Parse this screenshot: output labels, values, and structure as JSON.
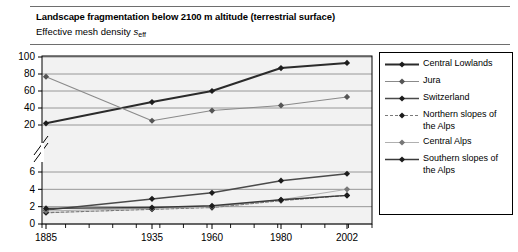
{
  "header": {
    "title": "Landscape fragmentation below 2100 m altitude (terrestrial surface)",
    "subtitle_prefix": "Effective mesh density ",
    "subtitle_symbol": "s",
    "subtitle_subscript": "eff"
  },
  "legend": {
    "items": [
      {
        "label": "Central Lowlands",
        "color": "#2b2b2b",
        "width": 1.9,
        "dash": "none"
      },
      {
        "label": "Jura",
        "color": "#8a8a8a",
        "width": 1.1,
        "dash": "none"
      },
      {
        "label": "Switzerland",
        "color": "#4a4a4a",
        "width": 1.5,
        "dash": "none"
      },
      {
        "label": "Northern slopes of the Alps",
        "color": "#7a7a7a",
        "width": 1.2,
        "dash": "3,2"
      },
      {
        "label": "Central Alps",
        "color": "#b0b0b0",
        "width": 1.1,
        "dash": "none"
      },
      {
        "label": "Southern slopes of the Alps",
        "color": "#3a3a3a",
        "width": 1.4,
        "dash": "none"
      }
    ]
  },
  "axis": {
    "x_ticks": [
      "1885",
      "1935",
      "1960",
      "1980",
      "2002"
    ],
    "y_ticks_lower": [
      "0",
      "2",
      "4",
      "6"
    ],
    "y_ticks_upper": [
      "20",
      "40",
      "60",
      "80",
      "100"
    ],
    "break_note": "axis-break"
  },
  "colors": {
    "gridline": "#808080",
    "frame": "#000000",
    "plot_background": "#f2f2f2",
    "rule": "#6e6e6e"
  },
  "chart_data": {
    "type": "line",
    "title": "Landscape fragmentation below 2100 m altitude (terrestrial surface)",
    "subtitle": "Effective mesh density s_eff",
    "xlabel": "",
    "ylabel": "",
    "x": [
      "1885",
      "1935",
      "1960",
      "1980",
      "2002"
    ],
    "axis_break": true,
    "ylim_lower": [
      0,
      6
    ],
    "ylim_upper": [
      20,
      100
    ],
    "grid": true,
    "legend_position": "right",
    "series": [
      {
        "name": "Central Lowlands",
        "values": [
          22,
          47,
          60,
          87,
          93
        ]
      },
      {
        "name": "Jura",
        "values": [
          17,
          25,
          37,
          43,
          53
        ]
      },
      {
        "name": "Switzerland",
        "values": [
          1.6,
          2.9,
          3.6,
          5.0,
          5.8
        ]
      },
      {
        "name": "Northern slopes of the Alps",
        "values": [
          1.3,
          1.7,
          1.9,
          2.7,
          3.3
        ]
      },
      {
        "name": "Central Alps",
        "values": [
          1.5,
          1.8,
          2.0,
          2.8,
          4.0
        ]
      },
      {
        "name": "Southern slopes of the Alps",
        "values": [
          1.8,
          1.9,
          2.1,
          2.8,
          3.3
        ]
      }
    ]
  }
}
